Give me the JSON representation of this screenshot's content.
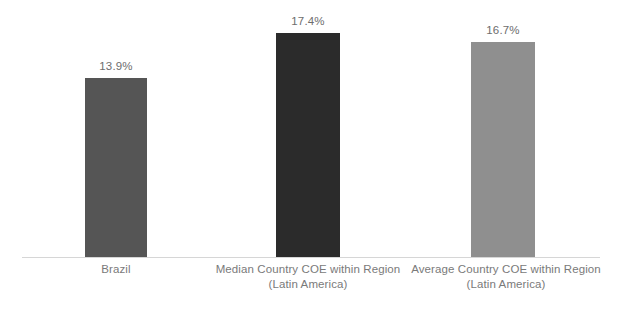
{
  "chart_data": {
    "type": "bar",
    "title": "",
    "subtitle": "",
    "xlabel": "",
    "ylabel": "",
    "ylim": [
      0,
      20
    ],
    "grid": false,
    "legend": false,
    "orientation": "vertical",
    "categories": [
      "Brazil",
      "Median Country COE within Region",
      "Average Country COE within Region"
    ],
    "category_sublabels": [
      "",
      "(Latin America)",
      "(Latin America)"
    ],
    "values": [
      13.9,
      17.4,
      16.7
    ],
    "value_labels": [
      "13.9%",
      "17.4%",
      "16.7%"
    ],
    "units": "%",
    "bar_colors": [
      "#555555",
      "#2b2b2b",
      "#8f8f8f"
    ],
    "axis_color": "#d6d6d6",
    "label_color": "#7a7a7a",
    "value_label_color": "#6d6d6d",
    "background": "#ffffff"
  },
  "bars": [
    {
      "name": "brazil",
      "category": "Brazil",
      "sublabel": "",
      "value_label": "13.9%",
      "value": 13.9,
      "color": "#555555"
    },
    {
      "name": "median-country-coe",
      "category": "Median Country COE within Region",
      "sublabel": "(Latin America)",
      "value_label": "17.4%",
      "value": 17.4,
      "color": "#2b2b2b"
    },
    {
      "name": "average-country-coe",
      "category": "Average Country COE within Region",
      "sublabel": "(Latin America)",
      "value_label": "16.7%",
      "value": 16.7,
      "color": "#8f8f8f"
    }
  ]
}
